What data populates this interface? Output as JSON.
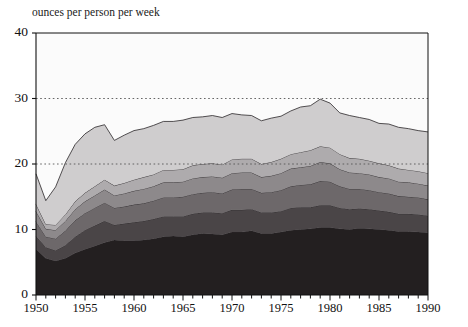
{
  "artifact": {
    "ghost_line": "·"
  },
  "chart_data": {
    "type": "area",
    "stacked": true,
    "title": "",
    "subtitle": "",
    "ylabel": "ounces per person per week",
    "xlabel": "",
    "xlim": [
      1950,
      1990
    ],
    "ylim": [
      0,
      40
    ],
    "yticks": [
      0,
      10,
      20,
      30,
      40
    ],
    "ytick_labels": [
      "0",
      "10",
      "20",
      "30",
      "40"
    ],
    "xticks": [
      1950,
      1955,
      1960,
      1965,
      1970,
      1975,
      1980,
      1985,
      1990
    ],
    "xtick_labels": [
      "1950",
      "1955",
      "1960",
      "1965",
      "1970",
      "1975",
      "1980",
      "1985",
      "1990"
    ],
    "minor_xtick_interval": 1,
    "gridlines": {
      "y": [
        20,
        30
      ],
      "style": "dotted",
      "color": "#555555"
    },
    "legend": {
      "visible": false
    },
    "x": [
      1950,
      1951,
      1952,
      1953,
      1954,
      1955,
      1956,
      1957,
      1958,
      1959,
      1960,
      1961,
      1962,
      1963,
      1964,
      1965,
      1966,
      1967,
      1968,
      1969,
      1970,
      1971,
      1972,
      1973,
      1974,
      1975,
      1976,
      1977,
      1978,
      1979,
      1980,
      1981,
      1982,
      1983,
      1984,
      1985,
      1986,
      1987,
      1988,
      1989,
      1990
    ],
    "series": [
      {
        "name": "layer-1-darkest",
        "color": "#231f20",
        "values": [
          7.0,
          5.6,
          5.2,
          5.6,
          6.4,
          7.0,
          7.5,
          8.0,
          8.4,
          8.3,
          8.3,
          8.4,
          8.6,
          8.9,
          9.0,
          8.9,
          9.2,
          9.4,
          9.3,
          9.2,
          9.6,
          9.6,
          9.8,
          9.4,
          9.4,
          9.6,
          9.9,
          10.0,
          10.1,
          10.3,
          10.3,
          10.1,
          10.0,
          10.2,
          10.1,
          10.0,
          9.9,
          9.7,
          9.7,
          9.6,
          9.5
        ]
      },
      {
        "name": "layer-2-dark",
        "color": "#4a4547",
        "values": [
          2.0,
          1.7,
          1.6,
          2.0,
          2.5,
          2.9,
          3.1,
          3.3,
          2.3,
          2.6,
          2.8,
          2.9,
          3.0,
          3.1,
          3.0,
          3.1,
          3.2,
          3.2,
          3.3,
          3.3,
          3.4,
          3.4,
          3.3,
          3.2,
          3.2,
          3.2,
          3.4,
          3.4,
          3.3,
          3.4,
          3.4,
          3.2,
          3.1,
          3.0,
          3.0,
          2.9,
          2.8,
          2.7,
          2.7,
          2.7,
          2.6
        ]
      },
      {
        "name": "layer-3-medium-dark",
        "color": "#6d686a",
        "values": [
          2.2,
          1.6,
          1.8,
          2.2,
          2.5,
          2.6,
          2.7,
          2.8,
          2.6,
          2.6,
          2.7,
          2.7,
          2.8,
          2.9,
          2.9,
          3.0,
          3.0,
          3.0,
          3.1,
          3.0,
          3.1,
          3.2,
          3.1,
          3.0,
          3.1,
          3.2,
          3.3,
          3.4,
          3.5,
          3.7,
          3.6,
          3.3,
          3.1,
          3.0,
          2.9,
          2.8,
          2.8,
          2.7,
          2.6,
          2.6,
          2.5
        ]
      },
      {
        "name": "layer-4-medium",
        "color": "#8d898b",
        "values": [
          1.6,
          1.2,
          1.3,
          1.5,
          1.7,
          1.8,
          1.9,
          2.0,
          1.9,
          2.0,
          2.1,
          2.2,
          2.2,
          2.3,
          2.3,
          2.3,
          2.4,
          2.4,
          2.4,
          2.4,
          2.5,
          2.5,
          2.5,
          2.4,
          2.5,
          2.6,
          2.7,
          2.7,
          2.8,
          2.9,
          2.8,
          2.6,
          2.5,
          2.4,
          2.4,
          2.3,
          2.3,
          2.2,
          2.2,
          2.1,
          2.1
        ]
      },
      {
        "name": "layer-5-light",
        "color": "#aeabad",
        "values": [
          1.1,
          0.7,
          0.8,
          1.0,
          1.2,
          1.3,
          1.4,
          1.5,
          1.5,
          1.6,
          1.7,
          1.8,
          1.8,
          1.9,
          1.9,
          1.9,
          2.0,
          2.0,
          2.0,
          2.0,
          2.1,
          2.1,
          2.1,
          2.0,
          2.1,
          2.2,
          2.2,
          2.3,
          2.4,
          2.4,
          2.4,
          2.3,
          2.2,
          2.2,
          2.1,
          2.1,
          2.0,
          2.0,
          1.9,
          1.9,
          1.9
        ]
      },
      {
        "name": "layer-6-lightest",
        "color": "#cfcdce",
        "values": [
          4.6,
          3.6,
          5.8,
          7.9,
          8.7,
          9.0,
          9.0,
          8.4,
          6.9,
          7.3,
          7.5,
          7.4,
          7.5,
          7.4,
          7.4,
          7.5,
          7.3,
          7.2,
          7.3,
          7.2,
          7.0,
          6.7,
          6.6,
          6.6,
          6.7,
          6.5,
          6.6,
          6.9,
          6.8,
          7.2,
          6.8,
          6.3,
          6.5,
          6.3,
          6.3,
          6.1,
          6.3,
          6.3,
          6.3,
          6.2,
          6.3
        ]
      }
    ]
  }
}
